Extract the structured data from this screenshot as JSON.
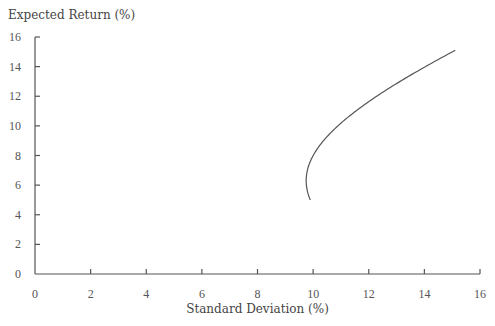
{
  "chart_data": {
    "type": "line",
    "title": "",
    "xlabel": "Standard Deviation (%)",
    "ylabel": "Expected Return (%)",
    "xlim": [
      0,
      16
    ],
    "ylim": [
      0,
      16
    ],
    "xticks": [
      0,
      2,
      4,
      6,
      8,
      10,
      12,
      14,
      16
    ],
    "yticks": [
      0,
      2,
      4,
      6,
      8,
      10,
      12,
      14,
      16
    ],
    "grid": false,
    "legend": null,
    "series": [
      {
        "name": "Efficient frontier",
        "x": [
          10.0,
          9.85,
          9.78,
          9.76,
          9.8,
          10.0,
          10.25,
          10.7,
          11.33,
          12.0,
          13.0,
          14.0,
          15.0
        ],
        "y": [
          5.0,
          5.6,
          6.0,
          6.3,
          6.8,
          7.6,
          8.6,
          9.7,
          10.9,
          11.9,
          13.1,
          14.1,
          15.1
        ]
      }
    ],
    "frontier_model": {
      "sigma_min": 9.75,
      "mu_at_sigma_min": 6.3,
      "k": 1.72,
      "mu_start": 5.0,
      "mu_end": 15.1
    }
  }
}
